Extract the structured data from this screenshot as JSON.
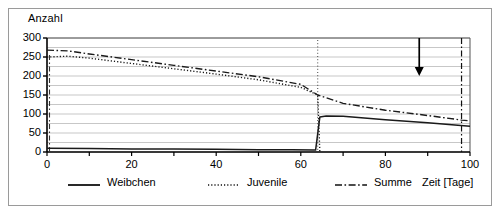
{
  "chart_data": {
    "type": "line",
    "title": "",
    "ylabel": "Anzahl",
    "xlabel": "Zeit [Tage]",
    "xlim": [
      0,
      100
    ],
    "ylim": [
      0,
      300
    ],
    "xticks": [
      0,
      20,
      40,
      60,
      80,
      100
    ],
    "xtick_labels": [
      "0",
      "20",
      "40",
      "60",
      "80",
      "100"
    ],
    "xminor_step": 10,
    "yticks": [
      0,
      50,
      100,
      150,
      200,
      250,
      300
    ],
    "ytick_labels": [
      "0",
      "50",
      "100",
      "150",
      "200",
      "250",
      "300"
    ],
    "grid": "horizontal-every-25",
    "legend_position": "bottom",
    "series": [
      {
        "name": "Weibchen",
        "style": "solid",
        "x": [
          0,
          10,
          20,
          30,
          40,
          50,
          58,
          63,
          63.5,
          64.5,
          66,
          70,
          80,
          90,
          100
        ],
        "y": [
          10,
          9,
          8,
          8,
          7,
          6,
          6,
          5,
          5,
          92,
          95,
          94,
          85,
          77,
          68
        ]
      },
      {
        "name": "Juvenile",
        "style": "dotted",
        "x": [
          0,
          5,
          10,
          20,
          30,
          40,
          50,
          60,
          64,
          64.5
        ],
        "y": [
          250,
          252,
          247,
          233,
          219,
          205,
          190,
          170,
          150,
          0
        ]
      },
      {
        "name": "Summe",
        "style": "dash-dot",
        "x": [
          0,
          5,
          10,
          20,
          30,
          40,
          50,
          60,
          64,
          70,
          80,
          90,
          98,
          100
        ],
        "y": [
          268,
          266,
          258,
          243,
          228,
          213,
          198,
          178,
          150,
          128,
          110,
          96,
          84,
          82
        ]
      }
    ],
    "annotations": [
      {
        "name": "down-arrow",
        "x": 88,
        "y_from": 300,
        "y_to": 200,
        "kind": "arrow-down"
      },
      {
        "name": "vertical-marker",
        "x": 98,
        "kind": "vertical-dash-dot"
      },
      {
        "name": "drop-marker",
        "x": 64,
        "kind": "vertical-dotted"
      }
    ],
    "colors": {
      "line": "#1a1a1a",
      "grid": "#b9b9b9",
      "axis": "#000000",
      "frame": "#9a9a9a",
      "background": "#ffffff"
    }
  },
  "legend": {
    "items": [
      {
        "label": "Weibchen",
        "style": "solid"
      },
      {
        "label": "Juvenile",
        "style": "dotted"
      },
      {
        "label": "Summe",
        "style": "dash-dot"
      }
    ]
  }
}
